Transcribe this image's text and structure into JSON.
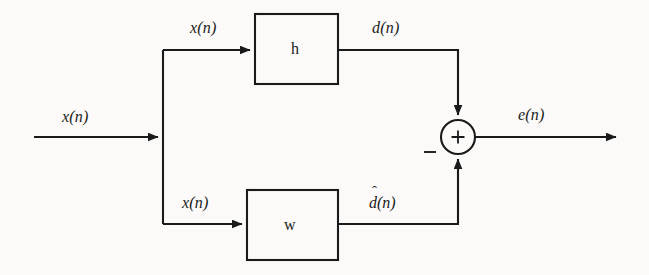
{
  "figure": {
    "type": "block-diagram",
    "background_color": "#fbfaf8",
    "line_color": "#1a1a1a"
  },
  "blocks": [
    {
      "id": "h",
      "label": "h",
      "x": 255,
      "y": 14,
      "width": 83,
      "height": 70
    },
    {
      "id": "w",
      "label": "w",
      "x": 247,
      "y": 190,
      "width": 91,
      "height": 70
    }
  ],
  "summing_junction": {
    "operator": "+",
    "negative_sign": "−",
    "center_x": 458,
    "center_y": 137,
    "radius": 17
  },
  "signals": {
    "input": "x(n)",
    "branch_top": "x(n)",
    "branch_bottom": "x(n)",
    "desired": "d(n)",
    "estimate_body": "d(n)",
    "estimate_hat": "ˆ",
    "error": "e(n)"
  }
}
